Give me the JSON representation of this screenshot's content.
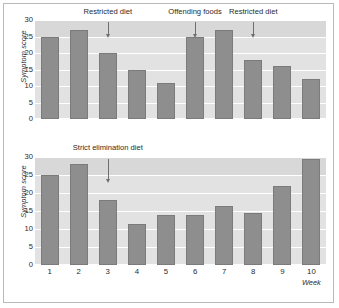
{
  "chart_data": [
    {
      "type": "bar",
      "id": "top",
      "title": "",
      "xlabel": "",
      "ylabel": "Symptom score",
      "categories": [
        "1",
        "2",
        "3",
        "4",
        "5",
        "6",
        "7",
        "8",
        "9",
        "10"
      ],
      "values": [
        25,
        27,
        20,
        15,
        11,
        25,
        27,
        18,
        16,
        12
      ],
      "ylim": [
        0,
        30
      ],
      "yticks": [
        "0",
        "5",
        "10",
        "15",
        "20",
        "25",
        "30"
      ],
      "grid": true,
      "legend": "none",
      "annotations": [
        {
          "label": "Restricted diet",
          "at_week": 2.5
        },
        {
          "label": "Offending foods",
          "at_week": 5.5
        },
        {
          "label": "Restricted diet",
          "at_week": 7.5
        }
      ]
    },
    {
      "type": "bar",
      "id": "bottom",
      "title": "",
      "xlabel": "Week",
      "ylabel": "Symptom score",
      "categories": [
        "1",
        "2",
        "3",
        "4",
        "5",
        "6",
        "7",
        "8",
        "9",
        "10"
      ],
      "values": [
        25,
        28,
        18,
        11.5,
        14,
        14,
        16.5,
        14.5,
        22,
        29.5
      ],
      "ylim": [
        0,
        30
      ],
      "yticks": [
        "0",
        "5",
        "10",
        "15",
        "20",
        "25",
        "30"
      ],
      "grid": true,
      "legend": "none",
      "annotations": [
        {
          "label": "Strict elimination diet",
          "at_week": 2.5
        }
      ]
    }
  ],
  "colors": {
    "bar": "#8e8e8e",
    "bar_edge": "#7b7b7b",
    "plot_background": "#e2e2e2",
    "plot_band_top": "#d8d8d8",
    "gridline": "#ffffff",
    "text": "#2b2b2b",
    "frame": "#b9b9b9"
  }
}
